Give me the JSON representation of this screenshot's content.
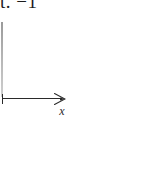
{
  "figure": {
    "type": "axis-fragment-diagram",
    "background_color": "#ffffff",
    "width": 143,
    "height": 178,
    "caption_fragment": "t.  −1",
    "axes": {
      "x_axis": {
        "label": "x",
        "has_arrowhead": true,
        "arrow_direction": "right",
        "line_color": "#2a2a2a",
        "origin_tick": true
      },
      "y_axis_stub": {
        "visible": true,
        "line_color": "#b4b4b4",
        "label": ""
      }
    }
  }
}
